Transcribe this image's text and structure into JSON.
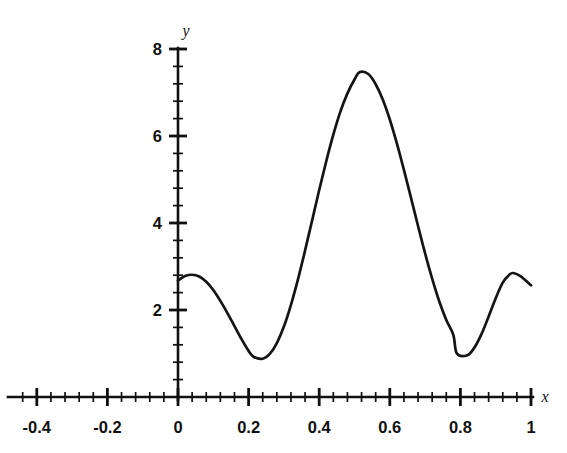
{
  "figure": {
    "caption_fragment": "",
    "background": "#ffffff",
    "curve_color": "#141414",
    "axis_color": "#111111"
  },
  "chart_data": {
    "type": "line",
    "title": "",
    "subtitle": "",
    "xlabel": "x",
    "ylabel": "y",
    "xlim": [
      -0.5,
      1.05
    ],
    "ylim": [
      0,
      8.6
    ],
    "grid": false,
    "legend": null,
    "legend_position": "none",
    "x_major_ticks": [
      -0.4,
      -0.2,
      0,
      0.2,
      0.4,
      0.6,
      0.8,
      1
    ],
    "x_tick_labels": [
      "-0.4",
      "-0.2",
      "0",
      "0.2",
      "0.4",
      "0.6",
      "0.8",
      "1"
    ],
    "x_minor_step": 0.04,
    "y_major_ticks": [
      2,
      4,
      6,
      8
    ],
    "y_tick_labels": [
      "2",
      "4",
      "6",
      "8"
    ],
    "y_minor_step": 0.4,
    "axes_style": "centered-spines-with-arrow-labels",
    "series": [
      {
        "name": "curve",
        "color": "#141414",
        "x": [
          0.0,
          0.02,
          0.04,
          0.06,
          0.08,
          0.1,
          0.12,
          0.14,
          0.16,
          0.18,
          0.2,
          0.215,
          0.24,
          0.26,
          0.28,
          0.3,
          0.32,
          0.34,
          0.36,
          0.38,
          0.4,
          0.42,
          0.44,
          0.46,
          0.48,
          0.5,
          0.515,
          0.54,
          0.56,
          0.58,
          0.6,
          0.62,
          0.64,
          0.66,
          0.68,
          0.7,
          0.72,
          0.74,
          0.76,
          0.78,
          0.79,
          0.82,
          0.84,
          0.86,
          0.88,
          0.9,
          0.92,
          0.94,
          0.95,
          0.97,
          1.0
        ],
        "y": [
          2.68,
          2.78,
          2.81,
          2.77,
          2.65,
          2.46,
          2.21,
          1.93,
          1.63,
          1.33,
          1.06,
          0.92,
          0.88,
          0.99,
          1.24,
          1.62,
          2.12,
          2.71,
          3.37,
          4.06,
          4.76,
          5.42,
          6.03,
          6.56,
          6.98,
          7.3,
          7.47,
          7.42,
          7.19,
          6.84,
          6.38,
          5.83,
          5.22,
          4.58,
          3.93,
          3.3,
          2.72,
          2.2,
          1.77,
          1.43,
          1.0,
          0.96,
          1.14,
          1.45,
          1.85,
          2.27,
          2.63,
          2.82,
          2.85,
          2.78,
          2.57
        ]
      }
    ],
    "annotations": [
      {
        "label": "global maximum",
        "x": 0.515,
        "y": 7.47
      },
      {
        "label": "left local minimum",
        "x": 0.215,
        "y": 0.88
      },
      {
        "label": "right local minimum",
        "x": 0.79,
        "y": 0.95
      },
      {
        "label": "left endpoint",
        "x": 0.0,
        "y": 2.68
      },
      {
        "label": "right endpoint",
        "x": 1.0,
        "y": 2.57
      }
    ]
  }
}
